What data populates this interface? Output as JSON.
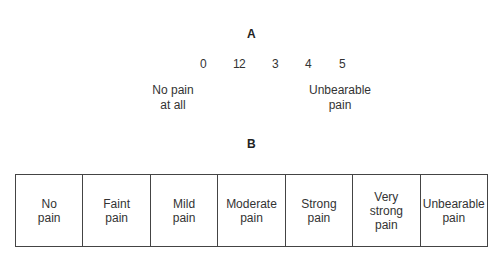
{
  "section_a": {
    "label": "A",
    "scale_numbers": [
      "0",
      "1",
      "2",
      "3",
      "4",
      "5"
    ],
    "anchor_left": [
      "No pain",
      "at all"
    ],
    "anchor_right": [
      "Unbearable",
      "pain"
    ]
  },
  "section_b": {
    "label": "B",
    "categories": [
      [
        "No",
        "pain"
      ],
      [
        "Faint",
        "pain"
      ],
      [
        "Mild",
        "pain"
      ],
      [
        "Moderate",
        "pain"
      ],
      [
        "Strong",
        "pain"
      ],
      [
        "Very",
        "strong",
        "pain"
      ],
      [
        "Unbearable",
        "pain"
      ]
    ]
  }
}
